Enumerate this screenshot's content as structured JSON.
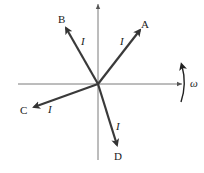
{
  "diagram": {
    "type": "phasor",
    "origin": {
      "x": 98,
      "y": 84
    },
    "axes": {
      "horizontal": {
        "x1": 18,
        "x2": 182,
        "y": 84,
        "color": "#7a7a7a"
      },
      "vertical": {
        "x": 98,
        "y1": 4,
        "y2": 160,
        "color": "#7a7a7a"
      }
    },
    "phasors": [
      {
        "name": "A",
        "label": "A",
        "magnitude_label": "I",
        "tip": {
          "x": 140,
          "y": 30
        },
        "label_pos": {
          "x": 141,
          "y": 28
        },
        "mag_pos": {
          "x": 120,
          "y": 45
        }
      },
      {
        "name": "B",
        "label": "B",
        "magnitude_label": "I",
        "tip": {
          "x": 66,
          "y": 28
        },
        "label_pos": {
          "x": 58,
          "y": 23
        },
        "mag_pos": {
          "x": 81,
          "y": 45
        }
      },
      {
        "name": "C",
        "label": "C",
        "magnitude_label": "I",
        "tip": {
          "x": 34,
          "y": 107
        },
        "label_pos": {
          "x": 20,
          "y": 114
        },
        "mag_pos": {
          "x": 48,
          "y": 113
        }
      },
      {
        "name": "D",
        "label": "D",
        "magnitude_label": "I",
        "tip": {
          "x": 117,
          "y": 145
        },
        "label_pos": {
          "x": 114,
          "y": 160
        },
        "mag_pos": {
          "x": 116,
          "y": 130
        }
      }
    ],
    "phasor_color": "#3a3a3a",
    "rotation": {
      "label": "ω",
      "direction": "counterclockwise"
    }
  }
}
